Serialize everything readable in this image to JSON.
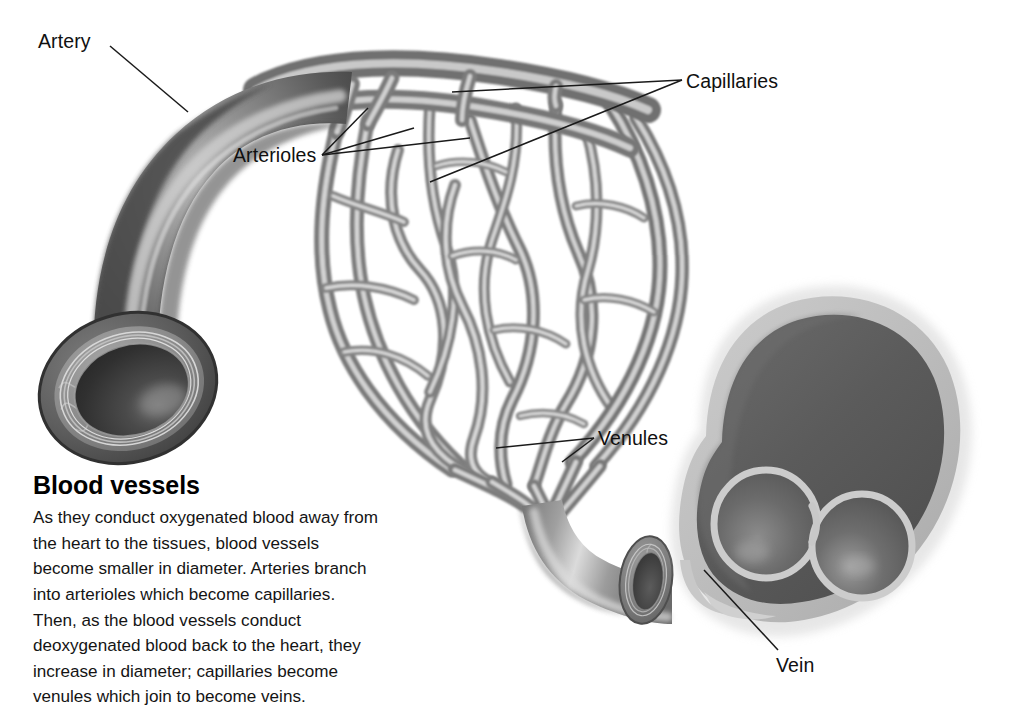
{
  "figure": {
    "background_color": "#ffffff",
    "labels": [
      {
        "id": "artery",
        "text": "Artery",
        "leader_count": 1
      },
      {
        "id": "capillaries",
        "text": "Capillaries",
        "leader_count": 2
      },
      {
        "id": "arterioles",
        "text": "Arterioles",
        "leader_count": 3
      },
      {
        "id": "venules",
        "text": "Venules",
        "leader_count": 2
      },
      {
        "id": "vein",
        "text": "Vein",
        "leader_count": 1
      }
    ],
    "colors": {
      "artery_dark": "#4c4c4c",
      "artery_mid": "#6f6f6f",
      "artery_highlight": "#c9c9c9",
      "artery_lumen": "#2f2f2f",
      "capillary_mid": "#8d8d8d",
      "capillary_highlight": "#d7d7d7",
      "vein_wall": "#bdbdbd",
      "vein_interior": "#5e5e5e",
      "leader_line": "#1a1a1a",
      "text": "#101010"
    },
    "structures": [
      "artery",
      "artery-cut-end",
      "arterioles",
      "capillary-network",
      "venules",
      "venule-cut-end",
      "vein",
      "vein-valves"
    ]
  },
  "caption": {
    "heading": "Blood vessels",
    "body": "As they conduct oxygenated blood away from the heart to the tissues, blood vessels become smaller in diameter. Arteries branch into arterioles which become capillaries. Then, as the blood vessels conduct deoxygenated blood back to the heart, they increase in diameter; capillaries become venules which join to become veins."
  }
}
